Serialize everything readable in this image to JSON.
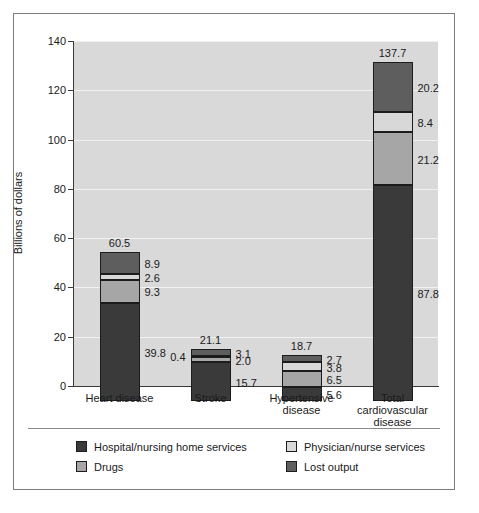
{
  "chart_data": {
    "type": "bar",
    "subtype": "stacked-bar",
    "title": "",
    "subtitle": "",
    "xlabel": "",
    "ylabel": "Billions of dollars",
    "ylim": [
      0,
      140
    ],
    "yticks": [
      0,
      20,
      40,
      60,
      80,
      100,
      120,
      140
    ],
    "ytick_labels": [
      "0",
      "20",
      "40",
      "60",
      "80",
      "100",
      "120",
      "140"
    ],
    "grid": true,
    "grid_axis": "y",
    "legend_position": "bottom",
    "categories": [
      "Heart disease",
      "Stroke",
      "Hypertensive disease",
      "Total cardiovascular disease"
    ],
    "category_lines": [
      [
        "Heart disease"
      ],
      [
        "Stroke"
      ],
      [
        "Hypertensive",
        "disease"
      ],
      [
        "Total cardiovascular",
        "disease"
      ]
    ],
    "series": [
      {
        "name": "Hospital/nursing home services",
        "color": "#3a3a3a",
        "values": [
          39.8,
          15.7,
          5.6,
          87.8
        ]
      },
      {
        "name": "Drugs",
        "color": "#a6a6a6",
        "values": [
          9.3,
          2.0,
          6.5,
          21.2
        ]
      },
      {
        "name": "Physician/nurse services",
        "color": "#d8d8d8",
        "values": [
          2.6,
          0.4,
          3.8,
          8.4
        ]
      },
      {
        "name": "Lost output",
        "color": "#5e5e5e",
        "values": [
          8.9,
          3.1,
          2.7,
          20.2
        ]
      }
    ],
    "totals": [
      60.5,
      21.1,
      18.7,
      137.7
    ],
    "total_labels": [
      "60.5",
      "21.1",
      "18.7",
      "137.7"
    ],
    "segment_labels": [
      [
        "39.8",
        "9.3",
        "2.6",
        "8.9"
      ],
      [
        "15.7",
        "2.0",
        "0.4",
        "3.1"
      ],
      [
        "5.6",
        "6.5",
        "3.8",
        "2.7"
      ],
      [
        "87.8",
        "21.2",
        "8.4",
        "20.2"
      ]
    ],
    "segment_label_side": [
      [
        "right",
        "right",
        "right",
        "right"
      ],
      [
        "right",
        "right",
        "left",
        "right"
      ],
      [
        "right",
        "right",
        "right",
        "right"
      ],
      [
        "right",
        "right",
        "right",
        "right"
      ]
    ],
    "plot_background": "#d9d9d9",
    "gridline_color": "#f2f2f2"
  },
  "legend": {
    "columns": [
      [
        {
          "label": "Hospital/nursing home services",
          "color": "#3a3a3a"
        },
        {
          "label": "Drugs",
          "color": "#a6a6a6"
        }
      ],
      [
        {
          "label": "Physician/nurse services",
          "color": "#d8d8d8"
        },
        {
          "label": "Lost output",
          "color": "#5e5e5e"
        }
      ]
    ]
  }
}
